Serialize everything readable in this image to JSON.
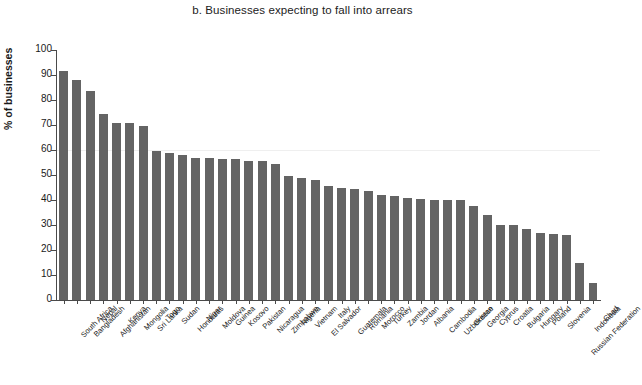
{
  "chart": {
    "title": "b. Businesses expecting to fall into arrears",
    "ylabel": "% of businesses"
  },
  "chart_data": {
    "type": "bar",
    "title": "b. Businesses expecting to fall into arrears",
    "xlabel": "",
    "ylabel": "% of businesses",
    "ylim": [
      0,
      100
    ],
    "yticks": [
      0,
      10,
      20,
      30,
      40,
      50,
      60,
      70,
      80,
      90,
      100
    ],
    "grid": false,
    "legend": null,
    "bar_color": "#646464",
    "categories": [
      "South Africa",
      "Bangladesh",
      "Nepal",
      "Afghanistan",
      "Kenya",
      "Mongolia",
      "Sri Lanka",
      "Togo",
      "Sudan",
      "Honduras",
      "Niger",
      "Moldova",
      "Guinea",
      "Kosovo",
      "Pakistan",
      "Nicaragua",
      "Zimbabwe",
      "Nigeria",
      "Vietnam",
      "El Salvador",
      "Italy",
      "Guatemala",
      "Romania",
      "Morocco",
      "Turkey",
      "Zambia",
      "Jordan",
      "Albania",
      "Cambodia",
      "Uzbekistan",
      "Greece",
      "Georgia",
      "Cyprus",
      "Croatia",
      "Bulgaria",
      "Hungary",
      "Poland",
      "Slovenia",
      "Russian Federation",
      "Indonesia",
      "Chad"
    ],
    "values": [
      91.5,
      88.0,
      83.5,
      74.5,
      71.0,
      71.0,
      69.5,
      59.5,
      59.0,
      58.0,
      57.0,
      57.0,
      56.5,
      56.5,
      55.5,
      55.5,
      54.5,
      49.5,
      49.0,
      48.0,
      45.5,
      45.0,
      44.5,
      43.5,
      42.0,
      41.5,
      41.0,
      40.5,
      40.0,
      40.0,
      40.0,
      37.5,
      34.0,
      30.0,
      30.0,
      28.5,
      27.0,
      26.5,
      26.0,
      15.0,
      7.0
    ]
  }
}
